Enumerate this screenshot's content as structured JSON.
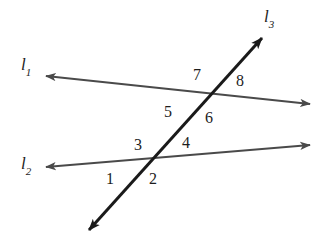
{
  "figure": {
    "background_color": "#ffffff",
    "width": 320,
    "height": 245
  },
  "lines": [
    {
      "id": "l1",
      "label": "l",
      "subscript": "1",
      "color": "#4a4a4a",
      "stroke_width": 2.0,
      "arrowheads": "both",
      "x1": 46,
      "y1": 76,
      "x2": 310,
      "y2": 104,
      "label_x": 21,
      "label_y": 56
    },
    {
      "id": "l2",
      "label": "l",
      "subscript": "2",
      "color": "#4a4a4a",
      "stroke_width": 2.0,
      "arrowheads": "both",
      "x1": 46,
      "y1": 167,
      "x2": 310,
      "y2": 145,
      "label_x": 21,
      "label_y": 155
    },
    {
      "id": "l3",
      "label": "l",
      "subscript": "3",
      "color": "#1a1a1a",
      "stroke_width": 3.0,
      "arrowheads": "both",
      "x1": 89,
      "y1": 230,
      "x2": 262,
      "y2": 38,
      "label_x": 264,
      "label_y": 8
    }
  ],
  "intersections": [
    {
      "name": "l1-l3",
      "x": 205,
      "y": 97
    },
    {
      "name": "l2-l3",
      "x": 152,
      "y": 163
    }
  ],
  "angles": [
    {
      "id": "angle-1",
      "label": "1",
      "x": 106,
      "y": 171,
      "intersection": "l2-l3",
      "position": "lower-left"
    },
    {
      "id": "angle-2",
      "label": "2",
      "x": 149,
      "y": 171,
      "intersection": "l2-l3",
      "position": "lower-right"
    },
    {
      "id": "angle-3",
      "label": "3",
      "x": 134,
      "y": 137,
      "intersection": "l2-l3",
      "position": "upper-left"
    },
    {
      "id": "angle-4",
      "label": "4",
      "x": 182,
      "y": 135,
      "intersection": "l2-l3",
      "position": "upper-right"
    },
    {
      "id": "angle-5",
      "label": "5",
      "x": 164,
      "y": 104,
      "intersection": "l1-l3",
      "position": "lower-left"
    },
    {
      "id": "angle-6",
      "label": "6",
      "x": 205,
      "y": 110,
      "intersection": "l1-l3",
      "position": "lower-right"
    },
    {
      "id": "angle-7",
      "label": "7",
      "x": 193,
      "y": 67,
      "intersection": "l1-l3",
      "position": "upper-left"
    },
    {
      "id": "angle-8",
      "label": "8",
      "x": 236,
      "y": 73,
      "intersection": "l1-l3",
      "position": "upper-right"
    }
  ]
}
